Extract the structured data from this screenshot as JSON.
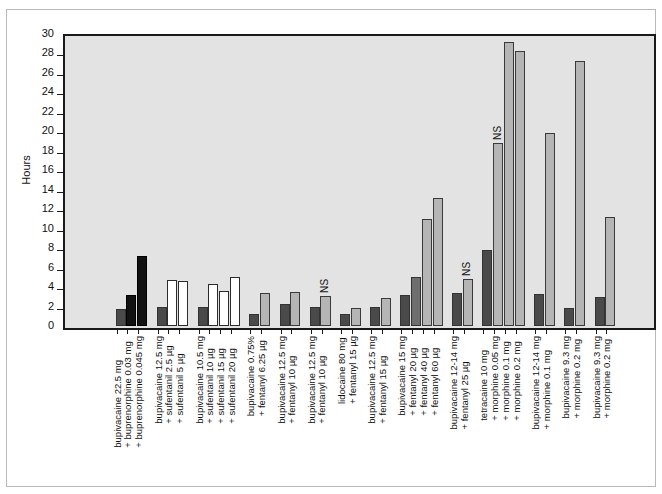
{
  "chart_data": {
    "type": "bar",
    "title": "",
    "xlabel": "",
    "ylabel": "Hours",
    "ylim": [
      0,
      30
    ],
    "ytick_step": 2,
    "yticks": [
      0,
      2,
      4,
      6,
      8,
      10,
      12,
      14,
      16,
      18,
      20,
      22,
      24,
      26,
      28,
      30
    ],
    "grid": false,
    "legend_position": "none",
    "annotation_label": "NS",
    "colors": {
      "plot_background": "#e3e3e3",
      "axis": "#1a1a1a",
      "bar_dark": "#4a4a4a",
      "bar_black": "#121212",
      "bar_white": "#ffffff",
      "bar_mid": "#6e6e6e",
      "bar_light": "#b5b5b5",
      "frame": "#b9b9b9"
    },
    "groups": [
      {
        "id": "group-1",
        "labels": [
          "bupivacaine 22.5 mg",
          "+ buprenorphine 0.03 mg",
          "+ buprenorphine 0.045 mg"
        ],
        "bars": [
          {
            "label": "bupivacaine 22.5 mg",
            "value": 1.7,
            "style": "dark",
            "ns": false
          },
          {
            "label": "+ buprenorphine 0.03 mg",
            "value": 3.2,
            "style": "black",
            "ns": false
          },
          {
            "label": "+ buprenorphine 0.045 mg",
            "value": 7.2,
            "style": "black",
            "ns": false
          }
        ]
      },
      {
        "id": "group-2",
        "labels": [
          "bupivacaine 12.5 mg",
          "+ sufentanil 2.5 µg",
          "+ sufentanil 5 µg"
        ],
        "bars": [
          {
            "label": "bupivacaine 12.5 mg",
            "value": 2.0,
            "style": "dark",
            "ns": false
          },
          {
            "label": "+ sufentanil 2.5 µg",
            "value": 4.7,
            "style": "white",
            "ns": false
          },
          {
            "label": "+ sufentanil 5 µg",
            "value": 4.6,
            "style": "white",
            "ns": false
          }
        ]
      },
      {
        "id": "group-3",
        "labels": [
          "bupivacaine 10.5 mg",
          "+ sufentanil 10 µg",
          "+ sufentanil 15 µg",
          "+ sufentanil 20 µg"
        ],
        "bars": [
          {
            "label": "bupivacaine 10.5 mg",
            "value": 1.95,
            "style": "dark",
            "ns": false
          },
          {
            "label": "+ sufentanil 10 µg",
            "value": 4.3,
            "style": "white",
            "ns": false
          },
          {
            "label": "+ sufentanil 15 µg",
            "value": 3.6,
            "style": "white",
            "ns": false
          },
          {
            "label": "+ sufentanil 20 µg",
            "value": 5.0,
            "style": "white",
            "ns": false
          }
        ]
      },
      {
        "id": "group-4",
        "labels": [
          "bupivacaine 0.75%",
          "+ fentanyl 6.25 µg"
        ],
        "bars": [
          {
            "label": "bupivacaine 0.75%",
            "value": 1.2,
            "style": "dark",
            "ns": false
          },
          {
            "label": "+ fentanyl 6.25 µg",
            "value": 3.4,
            "style": "light",
            "ns": false
          }
        ]
      },
      {
        "id": "group-5",
        "labels": [
          "bupivacaine 12.5 mg",
          "+ fentanyl 10 µg"
        ],
        "bars": [
          {
            "label": "bupivacaine 12.5 mg",
            "value": 2.3,
            "style": "dark",
            "ns": false
          },
          {
            "label": "+ fentanyl 10 µg",
            "value": 3.5,
            "style": "light",
            "ns": false
          }
        ]
      },
      {
        "id": "group-6",
        "labels": [
          "bupivacaine 12.5 mg",
          "+ fentanyl 10 µg"
        ],
        "bars": [
          {
            "label": "bupivacaine 12.5 mg",
            "value": 2.0,
            "style": "dark",
            "ns": false
          },
          {
            "label": "+ fentanyl 10 µg",
            "value": 3.1,
            "style": "light",
            "ns": true
          }
        ]
      },
      {
        "id": "group-7",
        "labels": [
          "lidocaine 80 mg",
          "+ fentanyl 15 µg"
        ],
        "bars": [
          {
            "label": "lidocaine 80 mg",
            "value": 1.2,
            "style": "dark",
            "ns": false
          },
          {
            "label": "+ fentanyl 15 µg",
            "value": 1.9,
            "style": "light",
            "ns": false
          }
        ]
      },
      {
        "id": "group-8",
        "labels": [
          "bupivacaine 12.5 mg",
          "+ fentanyl 15 µg"
        ],
        "bars": [
          {
            "label": "bupivacaine 12.5 mg",
            "value": 2.0,
            "style": "dark",
            "ns": false
          },
          {
            "label": "+ fentanyl 15 µg",
            "value": 2.9,
            "style": "light",
            "ns": false
          }
        ]
      },
      {
        "id": "group-9",
        "labels": [
          "bupivacaine 15 mg",
          "+ fentanyl 20 µg",
          "+ fentanyl 40 µg",
          "+ fentanyl 60 µg"
        ],
        "bars": [
          {
            "label": "bupivacaine 15 mg",
            "value": 3.2,
            "style": "dark",
            "ns": false
          },
          {
            "label": "+ fentanyl 20 µg",
            "value": 5.0,
            "style": "mid",
            "ns": false
          },
          {
            "label": "+ fentanyl 40 µg",
            "value": 11.0,
            "style": "light",
            "ns": false
          },
          {
            "label": "+ fentanyl 60 µg",
            "value": 13.2,
            "style": "light",
            "ns": false
          }
        ]
      },
      {
        "id": "group-10",
        "labels": [
          "bupivacaine 12-14 mg",
          "+ fentanyl 25 µg"
        ],
        "bars": [
          {
            "label": "bupivacaine 12-14 mg",
            "value": 3.4,
            "style": "dark",
            "ns": false
          },
          {
            "label": "+ fentanyl 25 µg",
            "value": 4.8,
            "style": "light",
            "ns": true
          }
        ]
      },
      {
        "id": "group-11",
        "labels": [
          "tetracaine 10 mg",
          "+ morphine 0.05 mg",
          "+ morphine 0.1 mg",
          "+ morphine 0.2 mg"
        ],
        "bars": [
          {
            "label": "tetracaine 10 mg",
            "value": 7.8,
            "style": "dark",
            "ns": false
          },
          {
            "label": "+ morphine 0.05 mg",
            "value": 18.8,
            "style": "light",
            "ns": true
          },
          {
            "label": "+ morphine 0.1 mg",
            "value": 29.2,
            "style": "light",
            "ns": false
          },
          {
            "label": "+ morphine 0.2 mg",
            "value": 28.3,
            "style": "light",
            "ns": false
          }
        ]
      },
      {
        "id": "group-12",
        "labels": [
          "bupivacaine 12-14 mg",
          "+ morphine 0.1 mg"
        ],
        "bars": [
          {
            "label": "bupivacaine 12-14 mg",
            "value": 3.3,
            "style": "dark",
            "ns": false
          },
          {
            "label": "+ morphine 0.1 mg",
            "value": 19.8,
            "style": "light",
            "ns": false
          }
        ]
      },
      {
        "id": "group-13",
        "labels": [
          "bupivacaine 9.3 mg",
          "+ morphine 0.2 mg"
        ],
        "bars": [
          {
            "label": "bupivacaine 9.3 mg",
            "value": 1.9,
            "style": "dark",
            "ns": false
          },
          {
            "label": "+ morphine 0.2 mg",
            "value": 27.2,
            "style": "light",
            "ns": false
          }
        ]
      },
      {
        "id": "group-14",
        "labels": [
          "bupivacaine 9.3 mg",
          "+ morphine 0.2 mg"
        ],
        "bars": [
          {
            "label": "bupivacaine 9.3 mg",
            "value": 3.0,
            "style": "dark",
            "ns": false
          },
          {
            "label": "+ morphine 0.2 mg",
            "value": 11.2,
            "style": "light",
            "ns": false
          }
        ]
      }
    ]
  }
}
